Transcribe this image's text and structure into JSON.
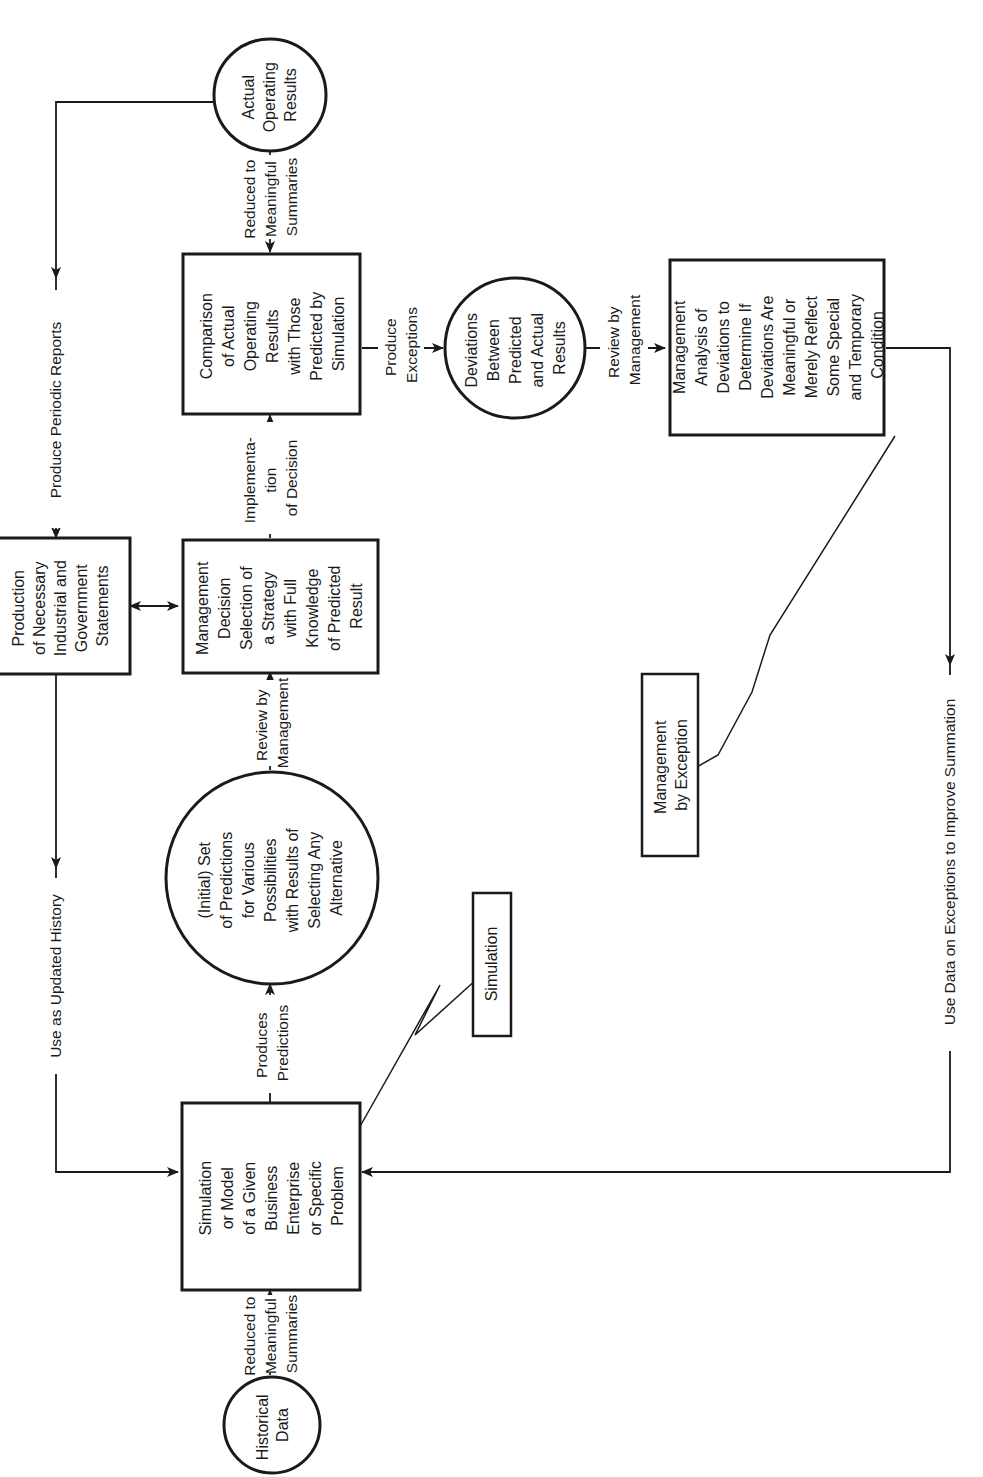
{
  "diagram": {
    "orientation": "rotated 90 degrees counter-clockwise (text reads bottom-to-top)",
    "colors": {
      "ink": "#1a1a1a",
      "background": "#ffffff"
    },
    "nodes": {
      "historical_data": {
        "shape": "circle",
        "lines": [
          "Historical",
          "Data"
        ]
      },
      "simulation_model": {
        "shape": "box",
        "lines": [
          "Simulation",
          "or Model",
          "of a Given",
          "Business",
          "Enterprise",
          "or Specific",
          "Problem"
        ]
      },
      "predictions": {
        "shape": "circle",
        "lines": [
          "(Initial) Set",
          "of Predictions",
          "for Various",
          "Possibilities",
          "with Results of",
          "Selecting Any",
          "Alternative"
        ]
      },
      "management_decision": {
        "shape": "box",
        "lines": [
          "Management",
          "Decision",
          "Selection of",
          "a Strategy",
          "with Full",
          "Knowledge",
          "of Predicted",
          "Result"
        ]
      },
      "production_statements": {
        "shape": "box",
        "lines": [
          "Production",
          "of Necessary",
          "Industrial and",
          "Government",
          "Statements"
        ]
      },
      "comparison": {
        "shape": "box",
        "lines": [
          "Comparison",
          "of Actual",
          "Operating",
          "Results",
          "with Those",
          "Predicted by",
          "Simulation"
        ]
      },
      "actual_results": {
        "shape": "circle",
        "lines": [
          "Actual",
          "Operating",
          "Results"
        ]
      },
      "deviations": {
        "shape": "circle",
        "lines": [
          "Deviations",
          "Between",
          "Predicted",
          "and Actual",
          "Results"
        ]
      },
      "management_analysis": {
        "shape": "box",
        "lines": [
          "Management",
          "Analysis of",
          "Deviations to",
          "Determine If",
          "Deviations Are",
          "Meaningful or",
          "Merely Reflect",
          "Some Special",
          "and Temporary",
          "Condition"
        ]
      },
      "simulation_callout": {
        "shape": "box",
        "lines": [
          "Simulation"
        ]
      },
      "mgmt_exception_callout": {
        "shape": "box",
        "lines": [
          "Management",
          "by Exception"
        ]
      }
    },
    "edges": {
      "hist_to_sim": {
        "lines": [
          "Reduced to",
          "Meaningful",
          "Summaries"
        ]
      },
      "sim_to_pred": {
        "lines": [
          "Produces",
          "Predictions"
        ]
      },
      "pred_to_decision": {
        "lines": [
          "Review by",
          "Management"
        ]
      },
      "decision_to_comparison": {
        "lines": [
          "Implementa-",
          "tion",
          "of Decision"
        ]
      },
      "actual_to_comparison": {
        "lines": [
          "Reduced to",
          "Meaningful",
          "Summaries"
        ]
      },
      "comparison_to_deviations": {
        "lines": [
          "Produce",
          "Exceptions"
        ]
      },
      "deviations_to_analysis": {
        "lines": [
          "Review by",
          "Management"
        ]
      },
      "actual_to_production": {
        "label": "Produce Periodic Reports"
      },
      "production_to_sim": {
        "label": "Use as Updated History"
      },
      "analysis_to_sim": {
        "label": "Use Data on Exceptions to Improve Summation"
      }
    }
  }
}
